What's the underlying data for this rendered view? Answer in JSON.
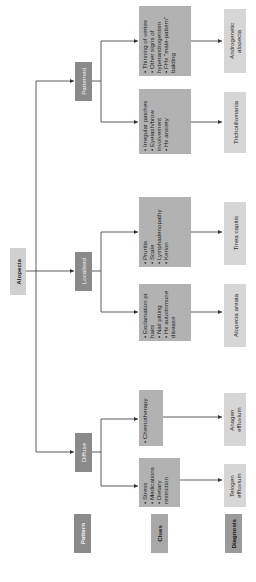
{
  "root": {
    "label": "Alopecia"
  },
  "patterns": [
    {
      "label": "Patterned",
      "branches": [
        {
          "clues": [
            "Thinning of vertex",
            "Other signs of hyperandrogenism",
            "FHx \"male-pattern\" balding"
          ],
          "diagnosis": "Androgenetic alopecia"
        },
        {
          "clues": [
            "Irregular patches",
            "Eyelash/brow involvement",
            "Hx anxiety"
          ],
          "diagnosis": "Trichotillomania"
        }
      ]
    },
    {
      "label": "Localised",
      "branches": [
        {
          "clues": [
            "Pruritis",
            "Scale",
            "Lymphadenopathy",
            "Kerion"
          ],
          "diagnosis": "Tinea capitis"
        },
        {
          "clues": [
            "Exclamation pt hairs",
            "Nail pitting",
            "Hx autoimmune disease"
          ],
          "diagnosis": "Alopecia areata"
        }
      ]
    },
    {
      "label": "Diffuse",
      "branches": [
        {
          "clues": [
            "Chemotherapy"
          ],
          "diagnosis": "Anagen effluvium"
        },
        {
          "clues": [
            "Stress",
            "Medications",
            "Dietary restriction"
          ],
          "diagnosis": "Telogen effluvium"
        }
      ]
    }
  ],
  "legend": {
    "pattern": "Pattern",
    "clues": "Clues",
    "diagnosis": "Diagnosis"
  },
  "colors": {
    "root": "#d0d0d0",
    "pattern": "#8a8a8a",
    "clue": "#b2b2b2",
    "diagnosis": "#d6d6d6",
    "line": "#333333"
  }
}
